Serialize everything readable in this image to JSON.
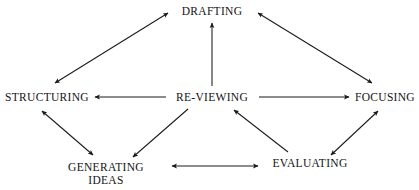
{
  "diagram": {
    "type": "node-link-diagram",
    "background_color": "#ffffff",
    "text_color": "#131313",
    "edge_color": "#1a1a1a",
    "nodes": [
      {
        "id": "drafting",
        "label": "DRAFTING",
        "x": 212,
        "y": 11
      },
      {
        "id": "structuring",
        "label": "STRUCTURING",
        "x": 47,
        "y": 97
      },
      {
        "id": "reviewing",
        "label": "RE-VIEWING",
        "x": 212,
        "y": 97
      },
      {
        "id": "focusing",
        "label": "FOCUSING",
        "x": 385,
        "y": 97
      },
      {
        "id": "generating",
        "label": "GENERATING\nIDEAS",
        "x": 106,
        "y": 174
      },
      {
        "id": "evaluating",
        "label": "EVALUATING",
        "x": 310,
        "y": 163
      }
    ],
    "edges": [
      {
        "from": "structuring",
        "to": "drafting",
        "direction": "both"
      },
      {
        "from": "drafting",
        "to": "focusing",
        "direction": "both"
      },
      {
        "from": "reviewing",
        "to": "drafting",
        "direction": "one"
      },
      {
        "from": "reviewing",
        "to": "structuring",
        "direction": "one"
      },
      {
        "from": "reviewing",
        "to": "focusing",
        "direction": "one"
      },
      {
        "from": "structuring",
        "to": "generating",
        "direction": "both"
      },
      {
        "from": "reviewing",
        "to": "generating",
        "direction": "one"
      },
      {
        "from": "evaluating",
        "to": "reviewing",
        "direction": "one"
      },
      {
        "from": "evaluating",
        "to": "focusing",
        "direction": "both"
      },
      {
        "from": "generating",
        "to": "evaluating",
        "direction": "both"
      }
    ]
  }
}
